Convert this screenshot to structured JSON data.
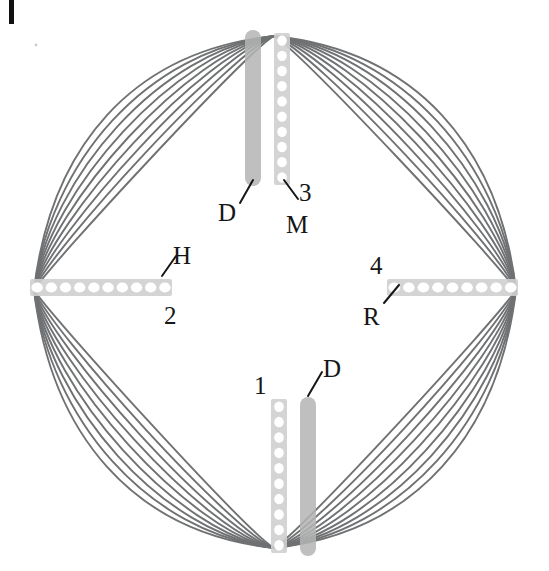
{
  "figure": {
    "type": "scientific-diagram",
    "background_color": "#ffffff",
    "curve_color": "#6f7173",
    "band_color": "#cfcfcf",
    "bead_color": "#ffffff",
    "disc_color": "#b4b4b4",
    "label_color": "#161616",
    "curve_count_per_quadrant": 9
  },
  "corner_mark": {
    "name": "page-edge-tick",
    "color": "#111111"
  },
  "labels": [
    {
      "id": "D-top",
      "text": "D",
      "x": 218,
      "y": 200,
      "leader": {
        "x1": 240,
        "x2": 253,
        "y1": 203,
        "y2": 180
      }
    },
    {
      "id": "M-top",
      "text": "M",
      "x": 286,
      "y": 212,
      "leader": {
        "x1": 298,
        "x2": 284,
        "y1": 199,
        "y2": 180
      }
    },
    {
      "id": "num-3",
      "text": "3",
      "x": 299,
      "y": 180,
      "leader": null
    },
    {
      "id": "H-left",
      "text": "H",
      "x": 173,
      "y": 243,
      "leader": {
        "x1": 176,
        "x2": 162,
        "y1": 256,
        "y2": 276
      }
    },
    {
      "id": "num-2",
      "text": "2",
      "x": 164,
      "y": 303,
      "leader": null
    },
    {
      "id": "num-4",
      "text": "4",
      "x": 370,
      "y": 253,
      "leader": null
    },
    {
      "id": "R-right",
      "text": "R",
      "x": 363,
      "y": 304,
      "leader": {
        "x1": 384,
        "x2": 399,
        "y1": 303,
        "y2": 285
      }
    },
    {
      "id": "num-1",
      "text": "1",
      "x": 254,
      "y": 373,
      "leader": null
    },
    {
      "id": "D-bottom",
      "text": "D",
      "x": 323,
      "y": 356,
      "leader": {
        "x1": 322,
        "x2": 308,
        "y1": 372,
        "y2": 396
      }
    }
  ],
  "bands": [
    {
      "id": "band-top-bead",
      "name": "m-line-band-top",
      "orientation": "vertical",
      "style": "beaded",
      "x": 274,
      "y": 33,
      "length": 152,
      "thickness": 16,
      "bead_count": 10
    },
    {
      "id": "disc-top",
      "name": "dense-disc-top",
      "orientation": "vertical",
      "style": "solid",
      "x": 245,
      "y": 30,
      "length": 156,
      "thickness": 16
    },
    {
      "id": "band-bottom-bead",
      "name": "z-line-band-bottom",
      "orientation": "vertical",
      "style": "beaded",
      "x": 271,
      "y": 399,
      "length": 154,
      "thickness": 16,
      "bead_count": 10
    },
    {
      "id": "disc-bottom",
      "name": "dense-disc-bottom",
      "orientation": "vertical",
      "style": "solid",
      "x": 300,
      "y": 397,
      "length": 159,
      "thickness": 16
    },
    {
      "id": "band-left",
      "name": "h-band-left",
      "orientation": "horizontal",
      "x": 30,
      "y": 279,
      "length": 142,
      "thickness": 17,
      "bead_count": 10
    },
    {
      "id": "band-right",
      "name": "r-band-right",
      "orientation": "horizontal",
      "x": 387,
      "y": 279,
      "length": 131,
      "thickness": 17,
      "bead_count": 9
    }
  ],
  "geometry": {
    "center_x": 274,
    "center_y": 290,
    "top_y": 36,
    "bottom_y": 548,
    "left_x": 34,
    "right_x": 516,
    "inner_offset_min": 28,
    "inner_offset_max": 150
  }
}
